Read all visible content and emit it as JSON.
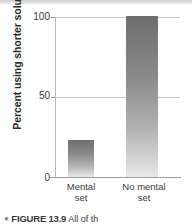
{
  "chart_data": {
    "type": "bar",
    "title": "",
    "xlabel": "",
    "ylabel": "Percent using shorter solution",
    "categories": [
      "Mental set",
      "No mental set"
    ],
    "values": [
      23,
      100
    ],
    "ylim": [
      0,
      100
    ],
    "yticks": [
      "0",
      "50",
      "100"
    ],
    "grid": true,
    "legend": "none",
    "bar_style": "vertical gradient, dark gray top to light gray bottom",
    "series": [
      {
        "name": "Percent using shorter solution",
        "values": [
          23,
          100
        ]
      }
    ]
  },
  "axis": {
    "y_title": "Percent using shorter solution",
    "tick_100": "100",
    "tick_50": "50",
    "tick_0": "0"
  },
  "categories": [
    {
      "line1": "Mental",
      "line2": "set"
    },
    {
      "line1": "No mental",
      "line2": "set"
    }
  ],
  "caption": {
    "bullet": "●",
    "figure_number": "FIGURE 13.9",
    "text": "All of th"
  },
  "colors": {
    "bar_top": "#6e6e6e",
    "bar_bottom": "#e9e9e9",
    "gridline": "#c4c4c4",
    "axis": "#9a9a9a",
    "text": "#3a3a3a",
    "background": "#ffffff"
  }
}
